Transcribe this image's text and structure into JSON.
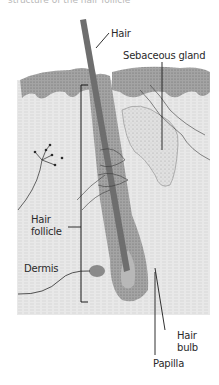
{
  "figure": {
    "caption_fragment": "structure of the hair follicle",
    "labels": {
      "hair": "Hair",
      "sebaceous_gland": "Sebaceous gland",
      "hair_follicle_line1": "Hair",
      "hair_follicle_line2": "follicle",
      "dermis": "Dermis",
      "hair_bulb_line1": "Hair",
      "hair_bulb_line2": "bulb",
      "papilla": "Papilla"
    },
    "colors": {
      "epidermis": "#9a9a9a",
      "dermis": "#e6e6e6",
      "hair_shaft": "#6e6e6e",
      "follicle": "#a8a8a8",
      "gland": "#d9d9d9",
      "leader_lines": "#1a1a1a"
    }
  }
}
